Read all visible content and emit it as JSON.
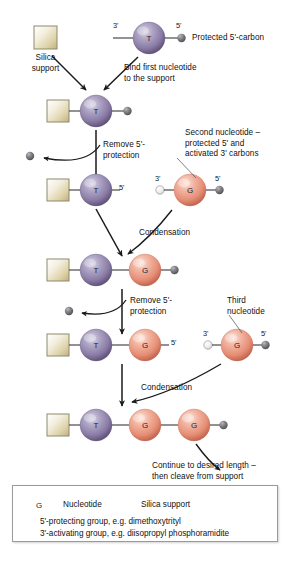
{
  "diagram": {
    "title_text": "Solid-phase oligonucleotide synthesis",
    "steps": {
      "silica_support": "Silica\nsupport",
      "protected_5_carbon": "Protected 5'-carbon",
      "bind_first": "Bind first nucleotide\nto the support",
      "remove_protection_1": "Remove 5'-\nprotection",
      "second_nucleotide": "Second nucleotide –\nprotected 5' and\nactivated 3' carbons",
      "condensation_1": "Condensation",
      "remove_protection_2": "Remove 5'-\nprotection",
      "third_nucleotide": "Third\nnucleotide",
      "condensation_2": "Condensation",
      "continue": "Continue to desired length –\nthen cleave from support"
    },
    "primes": {
      "three": "3'",
      "five": "5'"
    },
    "nucleotides": {
      "t": "T",
      "g": "G"
    }
  },
  "legend": {
    "nucleotide_symbol": "G",
    "nucleotide_label": "Nucleotide",
    "silica_label": "Silica support",
    "protecting_label": "5'-protecting group, e.g. dimethoxytrityl",
    "activating_label": "3'-activating group, e.g. diisopropyl phosphoramidite"
  },
  "colors": {
    "purple_nucleotide": "#8a7fa8",
    "salmon_nucleotide": "#e8907a",
    "silica_tan": "#cfc195",
    "protecting_dark": "#6d6d70",
    "activating_light": "#e2e2e2",
    "line": "#3a3a3a",
    "background": "#ffffff"
  }
}
